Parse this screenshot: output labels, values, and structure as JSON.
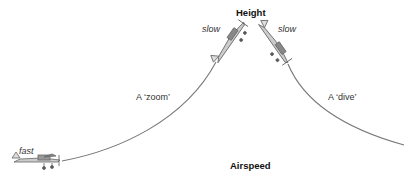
{
  "diagram": {
    "axis_labels": {
      "top": "Height",
      "bottom": "Airspeed"
    },
    "paths": [
      {
        "id": "zoom",
        "label": "A ‘zoom’",
        "direction": "climb"
      },
      {
        "id": "dive",
        "label": "A ‘dive’",
        "direction": "descend"
      }
    ],
    "speed_labels": {
      "low_left": "fast",
      "top_left": "slow",
      "top_right": "slow"
    },
    "colors": {
      "curve": "#777777",
      "aircraft": "#8a8a8a",
      "text": "#222222"
    }
  }
}
